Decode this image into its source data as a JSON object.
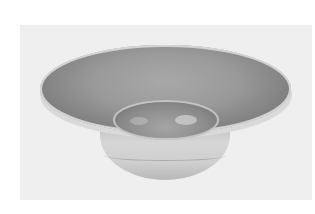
{
  "image": {
    "subject": "wide-rimmed ceramic bowl",
    "style": "grayscale photograph",
    "colors": {
      "page_background": "#ffffff",
      "photo_background": "#efefef",
      "rim_interior": "#9a9a9a",
      "rim_edge": "#d8d8d8",
      "well_interior": "#8a8a8a",
      "foot": "#d0d0d0"
    }
  }
}
